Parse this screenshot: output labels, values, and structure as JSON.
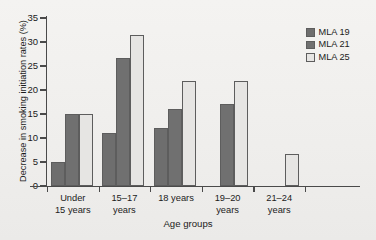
{
  "chart_data": {
    "type": "bar",
    "title": "",
    "xlabel": "Age groups",
    "ylabel": "Decrease in smoking initiation rates (%)",
    "categories": [
      "Under 15 years",
      "15–17 years",
      "18 years",
      "19–20 years",
      "21–24 years"
    ],
    "category_lines": [
      [
        "Under",
        "15 years"
      ],
      [
        "15–17",
        "years"
      ],
      [
        "18 years",
        ""
      ],
      [
        "19–20",
        "years"
      ],
      [
        "21–24",
        "years"
      ]
    ],
    "series": [
      {
        "name": "MLA 19",
        "color": "#6e6e6e",
        "values": [
          5,
          11,
          12,
          null,
          null
        ]
      },
      {
        "name": "MLA 21",
        "color": "#707070",
        "values": [
          15,
          26.7,
          16,
          17,
          null
        ]
      },
      {
        "name": "MLA 25",
        "color": "#e6e5e3",
        "values": [
          15,
          31.5,
          21.8,
          21.8,
          6.7
        ]
      }
    ],
    "ylim": [
      0,
      35
    ],
    "yticks": [
      0,
      5,
      10,
      15,
      20,
      25,
      30,
      35
    ],
    "ytick_labels": [
      "0",
      "5",
      "10",
      "15",
      "20",
      "25",
      "30",
      "35"
    ],
    "grid": false,
    "legend_position": "top-right"
  },
  "legend": {
    "items": [
      {
        "label": "MLA 19",
        "color": "#6e6e6e"
      },
      {
        "label": "MLA 21",
        "color": "#707070"
      },
      {
        "label": "MLA 25",
        "color": "#e6e5e3"
      }
    ]
  }
}
